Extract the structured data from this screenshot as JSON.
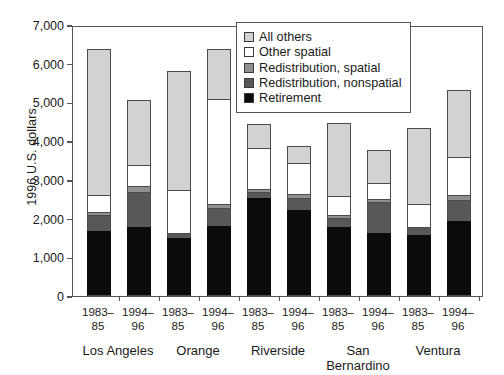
{
  "chart_data": {
    "type": "bar",
    "stacked": true,
    "title": "",
    "xlabel": "",
    "ylabel": "1996 U.S. dollars",
    "ylim": [
      0,
      7000
    ],
    "ytick_labels": [
      "7,000",
      "6,000",
      "5,000",
      "4,000",
      "3,000",
      "2,000",
      "1,000",
      "0"
    ],
    "ytick_values": [
      7000,
      6000,
      5000,
      4000,
      3000,
      2000,
      1000,
      0
    ],
    "grid": false,
    "legend_position": "top-center-inside",
    "series": [
      {
        "name": "Retirement",
        "color": "#0b0b0b",
        "values": [
          1680,
          1790,
          1490,
          1800,
          2530,
          2230,
          1770,
          1640,
          1580,
          1930
        ]
      },
      {
        "name": "Redistribution, nonspatial",
        "color": "#585858",
        "values": [
          400,
          890,
          130,
          480,
          150,
          310,
          240,
          790,
          210,
          540
        ]
      },
      {
        "name": "Redistribution, spatial",
        "color": "#909090",
        "values": [
          100,
          150,
          0,
          90,
          80,
          100,
          80,
          70,
          0,
          150
        ]
      },
      {
        "name": "Other spatial",
        "color": "#ffffff",
        "values": [
          420,
          550,
          1110,
          2730,
          1070,
          790,
          490,
          430,
          590,
          960
        ]
      },
      {
        "name": "All others",
        "color": "#d2d2d2",
        "values": [
          3770,
          1680,
          3090,
          1270,
          610,
          440,
          1880,
          830,
          1960,
          1740
        ]
      }
    ],
    "categories": [
      {
        "county": "Los Angeles",
        "period": "1983–\n85",
        "total": 6370
      },
      {
        "county": "Los Angeles",
        "period": "1994–\n96",
        "total": 5060
      },
      {
        "county": "Orange",
        "period": "1983–\n85",
        "total": 5820
      },
      {
        "county": "Orange",
        "period": "1994–\n96",
        "total": 6370
      },
      {
        "county": "Riverside",
        "period": "1983–\n85",
        "total": 4440
      },
      {
        "county": "Riverside",
        "period": "1994–\n96",
        "total": 3870
      },
      {
        "county": "San Bernardino",
        "period": "1983–\n85",
        "total": 4460
      },
      {
        "county": "San Bernardino",
        "period": "1994–\n96",
        "total": 3760
      },
      {
        "county": "Ventura",
        "period": "1983–\n85",
        "total": 4340
      },
      {
        "county": "Ventura",
        "period": "1994–\n96",
        "total": 5320
      }
    ],
    "groups": [
      {
        "label": "Los Angeles"
      },
      {
        "label": "Orange"
      },
      {
        "label": "Riverside"
      },
      {
        "label": "San\nBernardino"
      },
      {
        "label": "Ventura"
      }
    ]
  },
  "legend": {
    "items": [
      {
        "label": "All others",
        "color": "#d2d2d2"
      },
      {
        "label": "Other spatial",
        "color": "#ffffff"
      },
      {
        "label": "Redistribution, spatial",
        "color": "#909090"
      },
      {
        "label": "Redistribution, nonspatial",
        "color": "#585858"
      },
      {
        "label": "Retirement",
        "color": "#0b0b0b"
      }
    ]
  },
  "axis": {
    "y_title": "1996 U.S. dollars"
  }
}
